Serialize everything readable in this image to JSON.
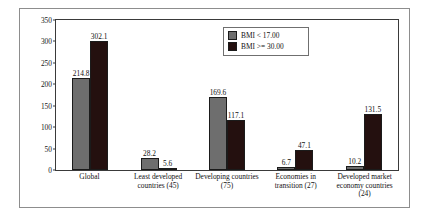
{
  "chart_data": {
    "type": "bar",
    "title": "",
    "xlabel": "",
    "ylabel": "Population affected (millions)",
    "ylim": [
      0,
      350
    ],
    "yticks": [
      "0",
      "50",
      "100",
      "150",
      "200",
      "250",
      "300",
      "350"
    ],
    "grid": false,
    "legend_position": "top-center-right",
    "categories": [
      "Global",
      "Least developed countries (45)",
      "Developing countries (75)",
      "Economies in transition (27)",
      "Developed market economy countries (24)"
    ],
    "series": [
      {
        "name": "BMI < 17.00",
        "color": "#6e6e6e",
        "values": [
          214.8,
          28.2,
          169.6,
          6.7,
          10.2
        ],
        "labels": [
          "214.8",
          "28.2",
          "169.6",
          "6.7",
          "10.2"
        ]
      },
      {
        "name": "BMI >= 30.00",
        "color": "#24100f",
        "values": [
          302.1,
          5.6,
          117.1,
          47.1,
          131.5
        ],
        "labels": [
          "302.1",
          "5.6",
          "117.1",
          "47.1",
          "131.5"
        ]
      }
    ]
  },
  "axis": {
    "y_title": "Population affected (millions)",
    "y_ticks": [
      {
        "value": 350,
        "label": "350"
      },
      {
        "value": 300,
        "label": "300"
      },
      {
        "value": 250,
        "label": "250"
      },
      {
        "value": 200,
        "label": "200"
      },
      {
        "value": 150,
        "label": "150"
      },
      {
        "value": 100,
        "label": "100"
      },
      {
        "value": 50,
        "label": "50"
      },
      {
        "value": 0,
        "label": "0"
      }
    ]
  },
  "legend": {
    "entries": [
      {
        "label": "BMI < 17.00",
        "color": "#6e6e6e"
      },
      {
        "label": "BMI >= 30.00",
        "color": "#24100f"
      }
    ]
  },
  "x_labels": [
    {
      "lines": [
        "Global"
      ]
    },
    {
      "lines": [
        "Least developed",
        "countries (45)"
      ]
    },
    {
      "lines": [
        "Developing countries",
        "(75)"
      ]
    },
    {
      "lines": [
        "Economies in",
        "transition (27)"
      ]
    },
    {
      "lines": [
        "Developed market",
        "economy countries",
        "(24)"
      ]
    }
  ]
}
